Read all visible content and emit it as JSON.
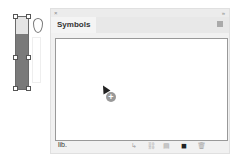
{
  "panel": {
    "close_glyph": "×",
    "collapse_glyph": "»",
    "tab_label": "Symbols",
    "menu_icon": "panel-menu-icon",
    "library_glyph": "lib.",
    "toolbar": [
      {
        "name": "place-symbol-instance",
        "glyph": "↳"
      },
      {
        "name": "break-link",
        "glyph": "⛓"
      },
      {
        "name": "symbol-options",
        "glyph": "▤"
      },
      {
        "name": "new-symbol",
        "glyph": "◼"
      },
      {
        "name": "delete-symbol",
        "glyph": "🗑"
      }
    ]
  },
  "drag": {
    "add_glyph": "+"
  }
}
